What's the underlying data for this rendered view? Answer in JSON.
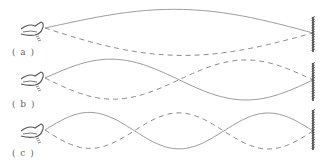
{
  "figure": {
    "colors": {
      "solid_wave": "#9a9a9a",
      "dashed_wave": "#8a8a8a",
      "hand": "#555555",
      "wall": "#444444",
      "label": "#666666"
    },
    "panels": [
      {
        "id": "a",
        "label": "( a )",
        "half_wavelengths": 1,
        "start_x": 45,
        "end_x": 313,
        "center_y": 33,
        "amplitude": 23,
        "hand_y": 28,
        "wall_top": 17,
        "wall_bottom": 52,
        "label_x": 12,
        "label_y": 47
      },
      {
        "id": "b",
        "label": "( b )",
        "half_wavelengths": 2,
        "start_x": 45,
        "end_x": 313,
        "center_y": 80,
        "amplitude": 20,
        "hand_y": 78,
        "wall_top": 63,
        "wall_bottom": 101,
        "label_x": 12,
        "label_y": 99
      },
      {
        "id": "c",
        "label": "( c )",
        "half_wavelengths": 3,
        "start_x": 45,
        "end_x": 313,
        "center_y": 131,
        "amplitude": 18,
        "hand_y": 130,
        "wall_top": 110,
        "wall_bottom": 150,
        "label_x": 12,
        "label_y": 148
      }
    ]
  }
}
